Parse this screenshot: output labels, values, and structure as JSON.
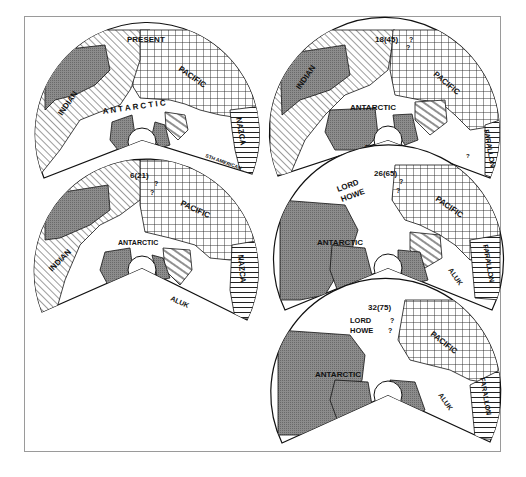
{
  "figure": {
    "panels": [
      {
        "id": "present",
        "age_label": "PRESENT",
        "labels": {
          "indian": "INDIAN",
          "pacific": "PACIFIC",
          "antarctic": "A N T A R C T I C",
          "nazca": "NAZCA",
          "sth_american": "STH AMERICAN"
        }
      },
      {
        "id": "6-21",
        "age_label": "6(21)",
        "labels": {
          "indian": "INDIAN",
          "pacific": "PACIFIC",
          "antarctic": "ANTARCTIC",
          "nazca": "NAZCA",
          "aluk": "ALUK",
          "q1": "?",
          "q2": "?"
        }
      },
      {
        "id": "18-45",
        "age_label": "18(45)",
        "labels": {
          "indian": "INDIAN",
          "pacific": "PACIFIC",
          "antarctic": "ANTARCTIC",
          "bellings": "BELLINGS-",
          "hausen": "HAUSEN",
          "aluk": "ALUK",
          "farallon": "FARALLON",
          "q1": "?",
          "q2": "?",
          "q3": "?"
        }
      },
      {
        "id": "26-65",
        "age_label": "26(65)",
        "labels": {
          "lord": "LORD",
          "howe": "HOWE",
          "pacific": "PACIFIC",
          "antarctic": "ANTARCTIC",
          "aluk": "ALUK",
          "farallon": "FARALLON",
          "q1": "?",
          "q2": "?"
        }
      },
      {
        "id": "32-75",
        "age_label": "32(75)",
        "labels": {
          "lord": "LORD",
          "howe": "HOWE",
          "pacific": "PACIFIC",
          "antarctic": "ANTARCTIC",
          "aluk": "ALUK",
          "farallon": "FARALLON",
          "q1": "?",
          "q2": "?"
        }
      }
    ]
  }
}
